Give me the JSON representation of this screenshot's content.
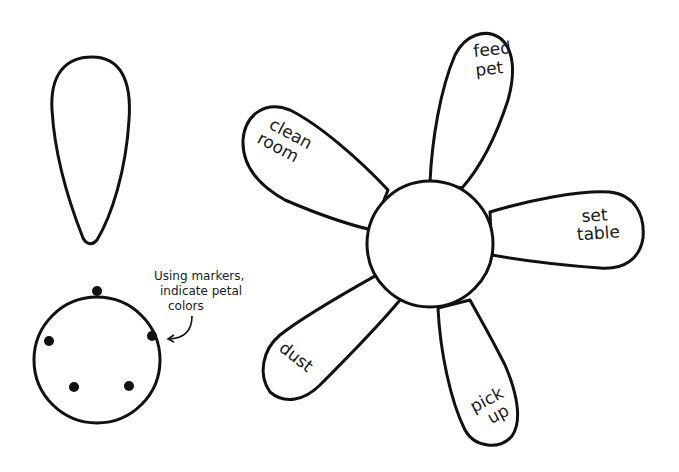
{
  "template_petal": {
    "label": ""
  },
  "center_template": {
    "dots": 5,
    "annotation": {
      "line1": "Using markers,",
      "line2": "indicate petal",
      "line3": "colors"
    }
  },
  "flower": {
    "petals": [
      {
        "id": "feed-pet",
        "line1": "feed",
        "line2": "pet"
      },
      {
        "id": "clean-room",
        "line1": "clean",
        "line2": "room"
      },
      {
        "id": "set-table",
        "line1": "set",
        "line2": "table"
      },
      {
        "id": "dust",
        "line1": "dust",
        "line2": ""
      },
      {
        "id": "pick-up",
        "line1": "pick",
        "line2": "up"
      }
    ]
  },
  "colors": {
    "stroke": "#111111",
    "background": "#ffffff"
  }
}
